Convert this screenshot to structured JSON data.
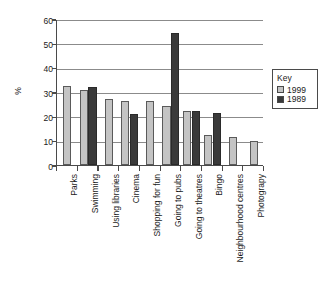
{
  "chart_data": {
    "type": "bar",
    "title": "",
    "xlabel": "",
    "ylabel": "%",
    "ylim": [
      0,
      60
    ],
    "ytick_step": 10,
    "yticks": [
      60,
      50,
      40,
      30,
      20,
      10,
      0
    ],
    "grid": true,
    "legend_position": "right",
    "categories": [
      "Parks",
      "Swimming",
      "Using libraries",
      "Cinema",
      "Shopping for fun",
      "Going to pubs",
      "Going to theatres",
      "Bingo",
      "Neighbourhood centres",
      "Photograpy"
    ],
    "series": [
      {
        "name": "1999",
        "color": "#c4c4c4",
        "values": [
          32.5,
          30.7,
          27.1,
          26.5,
          26.5,
          24.3,
          22.2,
          12.3,
          11.6,
          9.9
        ]
      },
      {
        "name": "1989",
        "color": "#3a3a3a",
        "values": [
          null,
          32.1,
          null,
          21.0,
          null,
          54.3,
          22.3,
          21.2,
          null,
          null
        ]
      }
    ]
  },
  "legend": {
    "title": "Key",
    "entries": [
      {
        "label": "1999",
        "color": "#c4c4c4"
      },
      {
        "label": "1989",
        "color": "#3a3a3a"
      }
    ]
  },
  "axis": {
    "y_title": "%"
  }
}
